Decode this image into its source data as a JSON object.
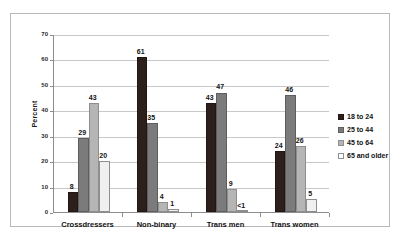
{
  "chart_data": {
    "type": "bar",
    "title": "",
    "xlabel": "",
    "ylabel": "Percent",
    "ylim": [
      0,
      70
    ],
    "yticks": [
      0,
      10,
      20,
      30,
      40,
      50,
      60,
      70
    ],
    "grid": true,
    "legend_position": "right",
    "categories": [
      "Crossdressers",
      "Non-binary",
      "Trans men",
      "Trans women"
    ],
    "series": [
      {
        "name": "18 to 24",
        "color": "#2d1f1c",
        "values": [
          8,
          61,
          43,
          24
        ],
        "labels": [
          "8",
          "61",
          "43",
          "24"
        ]
      },
      {
        "name": "25 to 44",
        "color": "#7b7b7b",
        "values": [
          29,
          35,
          47,
          46
        ],
        "labels": [
          "29",
          "35",
          "47",
          "46"
        ]
      },
      {
        "name": "45 to 64",
        "color": "#b5b5b5",
        "values": [
          43,
          4,
          9,
          26
        ],
        "labels": [
          "43",
          "4",
          "9",
          "26"
        ]
      },
      {
        "name": "65 and older",
        "color": "#f0f0f0",
        "values": [
          20,
          1,
          0.4,
          5
        ],
        "labels": [
          "20",
          "1",
          "<1",
          "5"
        ]
      }
    ]
  }
}
